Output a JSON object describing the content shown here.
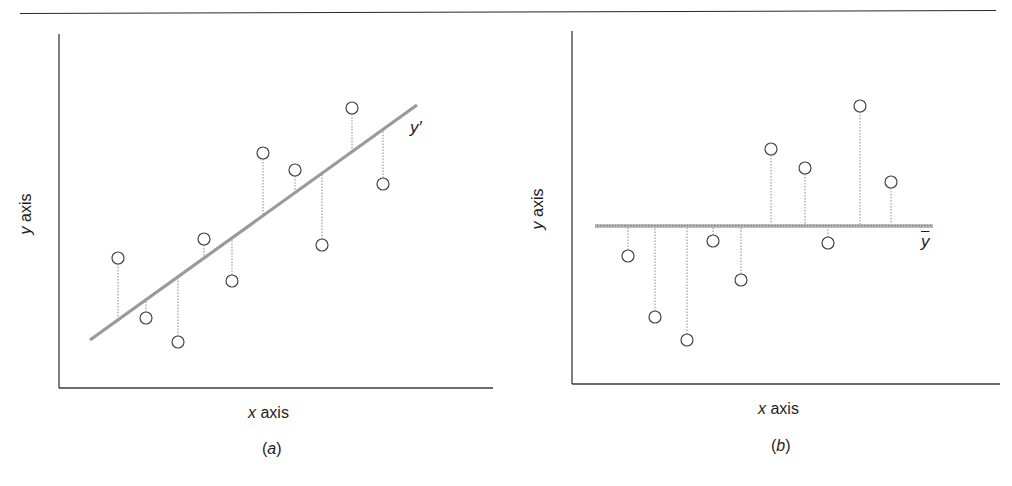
{
  "figure": {
    "panel_a": {
      "caption_letter": "a",
      "xlabel_var": "x",
      "xlabel_word": "axis",
      "ylabel_var": "y",
      "ylabel_word": "axis",
      "line_label": "y′"
    },
    "panel_b": {
      "caption_letter": "b",
      "xlabel_var": "x",
      "xlabel_word": "axis",
      "ylabel_var": "y",
      "ylabel_word": "axis",
      "line_label": "y"
    }
  },
  "colors": {
    "axis": "#3a3a3a",
    "fit_line": "#9a9a9a",
    "residual": "#8a8a8a",
    "marker": "#444444"
  },
  "chart_data": [
    {
      "type": "scatter",
      "title": "(a)",
      "xlabel": "x axis",
      "ylabel": "y axis",
      "description": "Scatter of 10 points with fitted regression line y′; dotted vertical lines show residuals from each point to the regression line",
      "grid": false,
      "legend": null,
      "annotations": [
        "y′"
      ],
      "x": [
        118,
        146,
        178,
        204,
        232,
        263,
        295,
        322,
        352,
        383
      ],
      "y": [
        258,
        318,
        342,
        239,
        281,
        153,
        170,
        245,
        108,
        184
      ],
      "fit_line": {
        "x1": 90,
        "y1": 340,
        "x2": 417,
        "y2": 105,
        "label": "y′"
      },
      "units": "pixel coordinates (no numeric tick labels shown)"
    },
    {
      "type": "scatter",
      "title": "(b)",
      "xlabel": "x axis",
      "ylabel": "y axis",
      "description": "Same style scatter of 10 points with horizontal mean line ȳ; dotted vertical lines show deviations from each point to the mean",
      "grid": false,
      "legend": null,
      "annotations": [
        "ȳ"
      ],
      "x": [
        628,
        655,
        687,
        713,
        741,
        771,
        805,
        828,
        860,
        891
      ],
      "y": [
        256,
        317,
        340,
        241,
        280,
        149,
        168,
        243,
        106,
        182
      ],
      "mean_line": {
        "x1": 595,
        "x2": 933,
        "y": 226,
        "label": "ȳ"
      },
      "units": "pixel coordinates (no numeric tick labels shown)"
    }
  ]
}
